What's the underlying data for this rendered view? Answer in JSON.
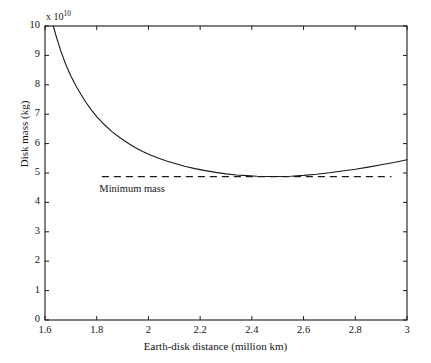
{
  "chart_data": {
    "type": "line",
    "title": "",
    "xlabel": "Earth-disk distance (million km)",
    "ylabel": "Disk mass (kg)",
    "y_exponent_label": "x 10",
    "y_exponent_power": "10",
    "xlim": [
      1.6,
      3.0
    ],
    "ylim": [
      0,
      10
    ],
    "xticks": [
      "1.6",
      "1.8",
      "2",
      "2.2",
      "2.4",
      "2.6",
      "2.8",
      "3"
    ],
    "xtick_values": [
      1.6,
      1.8,
      2.0,
      2.2,
      2.4,
      2.6,
      2.8,
      3.0
    ],
    "yticks": [
      "0",
      "1",
      "2",
      "3",
      "4",
      "5",
      "6",
      "7",
      "8",
      "9",
      "10"
    ],
    "ytick_values": [
      0,
      1,
      2,
      3,
      4,
      5,
      6,
      7,
      8,
      9,
      10
    ],
    "grid": false,
    "legend": "none",
    "box": true,
    "series": [
      {
        "name": "Disk mass",
        "style": "solid",
        "color": "#1a1a1a",
        "x": [
          1.632,
          1.645,
          1.66,
          1.68,
          1.7,
          1.72,
          1.74,
          1.76,
          1.78,
          1.8,
          1.83,
          1.86,
          1.89,
          1.92,
          1.95,
          1.98,
          2.01,
          2.04,
          2.07,
          2.1,
          2.14,
          2.18,
          2.22,
          2.26,
          2.3,
          2.34,
          2.38,
          2.42,
          2.46,
          2.5,
          2.55,
          2.6,
          2.65,
          2.7,
          2.75,
          2.8,
          2.85,
          2.9,
          2.95,
          3.0
        ],
        "y": [
          10.0,
          9.6,
          9.18,
          8.7,
          8.3,
          7.96,
          7.66,
          7.38,
          7.14,
          6.92,
          6.64,
          6.4,
          6.2,
          6.02,
          5.86,
          5.72,
          5.6,
          5.5,
          5.41,
          5.33,
          5.23,
          5.15,
          5.08,
          5.02,
          4.97,
          4.93,
          4.91,
          4.89,
          4.88,
          4.88,
          4.89,
          4.92,
          4.96,
          5.01,
          5.07,
          5.13,
          5.2,
          5.28,
          5.36,
          5.45
        ]
      },
      {
        "name": "Minimum mass",
        "style": "dashed",
        "color": "#1a1a1a",
        "x_start": 1.82,
        "x_end": 2.94,
        "y_value": 4.875
      }
    ],
    "annotations": [
      {
        "text": "Minimum mass",
        "x": 1.81,
        "y": 4.42
      }
    ]
  }
}
